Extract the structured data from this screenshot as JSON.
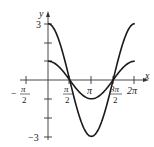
{
  "chart_data": {
    "type": "line",
    "title": "",
    "xlabel": "x",
    "ylabel": "y",
    "xlim": [
      -1.7,
      7.0
    ],
    "ylim": [
      -3.2,
      3.6
    ],
    "grid": false,
    "legend": null,
    "x_ticks": [
      {
        "value": -1.5708,
        "label_num": "π",
        "label_den": "2",
        "sign": "−",
        "label": "-π/2"
      },
      {
        "value": 1.5708,
        "label_num": "π",
        "label_den": "2",
        "sign": "",
        "label": "π/2"
      },
      {
        "value": 3.1416,
        "label": "π"
      },
      {
        "value": 4.7124,
        "label_num": "3π",
        "label_den": "2",
        "sign": "",
        "label": "3π/2"
      },
      {
        "value": 6.2832,
        "label": "2π"
      }
    ],
    "y_ticks": [
      {
        "value": 3,
        "label": "3"
      },
      {
        "value": 2,
        "label": ""
      },
      {
        "value": 1,
        "label": ""
      },
      {
        "value": -1,
        "label": ""
      },
      {
        "value": -2,
        "label": ""
      },
      {
        "value": -3,
        "label": "−3"
      }
    ],
    "series": [
      {
        "name": "y = 3cos x",
        "function": "3*cos(x)",
        "domain": [
          0,
          6.2832
        ],
        "x": [
          0,
          0.7854,
          1.5708,
          2.3562,
          3.1416,
          3.927,
          4.7124,
          5.4978,
          6.2832
        ],
        "values": [
          3,
          2.12,
          0,
          -2.12,
          -3,
          -2.12,
          0,
          2.12,
          3
        ]
      },
      {
        "name": "y = cos x",
        "function": "cos(x)",
        "domain": [
          0,
          6.2832
        ],
        "x": [
          0,
          0.7854,
          1.5708,
          2.3562,
          3.1416,
          3.927,
          4.7124,
          5.4978,
          6.2832
        ],
        "values": [
          1,
          0.71,
          0,
          -0.71,
          -1,
          -0.71,
          0,
          0.71,
          1
        ]
      }
    ]
  },
  "labels": {
    "y_axis": "y",
    "x_axis": "x",
    "y_top": "3",
    "y_bottom": "−3",
    "neg_half_pi_sign": "−",
    "neg_half_pi_num": "π",
    "neg_half_pi_den": "2",
    "half_pi_num": "π",
    "half_pi_den": "2",
    "pi": "π",
    "three_half_pi_num": "3π",
    "three_half_pi_den": "2",
    "two_pi": "2π"
  },
  "colors": {
    "curve": "#1a1a1a",
    "axis": "#333333"
  }
}
